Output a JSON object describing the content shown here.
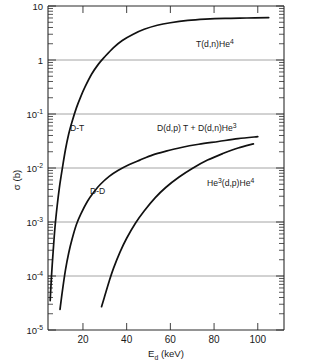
{
  "chart_data": {
    "type": "line",
    "title": "",
    "xlabel": "E_d (keV)",
    "ylabel": "σ (b)",
    "xlabel_parts": {
      "base": "E",
      "sub": "d",
      "units": "(keV)"
    },
    "xscale": "linear",
    "yscale": "log",
    "xlim": [
      4,
      112
    ],
    "ylim": [
      1e-05,
      10
    ],
    "grid": "horizontal-decades",
    "legend": "inline-annotations",
    "xticks": [
      20,
      40,
      60,
      80,
      100
    ],
    "xtick_labels": [
      "20",
      "40",
      "60",
      "80",
      "100"
    ],
    "yticks": [
      10,
      1,
      0.1,
      0.01,
      0.001,
      0.0001,
      1e-05
    ],
    "ytick_labels": [
      "10",
      "1",
      "10",
      "10",
      "10",
      "10",
      "10"
    ],
    "ytick_exponents": [
      "",
      "",
      "-1",
      "-2",
      "-3",
      "-4",
      "-5"
    ],
    "series": [
      {
        "name": "D-T",
        "label": "T(d,n)He4",
        "label_parts": {
          "base": "T(d,n)He",
          "sup": "4"
        },
        "short_label": "D-T",
        "x": [
          5.0,
          5.6,
          6.4,
          7.2,
          8.2,
          9.2,
          10.5,
          12.0,
          13.5,
          15.0,
          17.0,
          19.0,
          21.0,
          24.0,
          27.0,
          30.0,
          34.0,
          38.0,
          43.0,
          48.0,
          54.0,
          60.0,
          68.0,
          76.0,
          85.0,
          95.0,
          105.0
        ],
        "y": [
          3.5e-05,
          0.0001,
          0.0003,
          0.0008,
          0.002,
          0.0043,
          0.0095,
          0.022,
          0.043,
          0.072,
          0.13,
          0.21,
          0.32,
          0.55,
          0.83,
          1.15,
          1.7,
          2.3,
          3.0,
          3.7,
          4.4,
          4.9,
          5.4,
          5.7,
          5.9,
          6.0,
          6.1
        ]
      },
      {
        "name": "D-D",
        "label": "D(d,p) T + D(d,n)He3",
        "label_parts": {
          "base": "D(d,p) T  +  D(d,n)He",
          "sup": "3"
        },
        "short_label": "D-D",
        "x": [
          9.5,
          10.5,
          12.0,
          13.5,
          15.0,
          17.0,
          19.0,
          22.0,
          25.0,
          28.0,
          32.0,
          36.0,
          41.0,
          46.0,
          52.0,
          58.0,
          65.0,
          73.0,
          82.0,
          91.0,
          100.0
        ],
        "y": [
          2.4e-05,
          5e-05,
          0.00013,
          0.00027,
          0.00048,
          0.0009,
          0.0014,
          0.0024,
          0.0036,
          0.005,
          0.007,
          0.009,
          0.0115,
          0.014,
          0.0175,
          0.0205,
          0.024,
          0.0275,
          0.031,
          0.035,
          0.038
        ]
      },
      {
        "name": "He3-D",
        "label": "He3(d,p)He4",
        "label_parts": {
          "pre_sup": "3",
          "base_start": "He",
          "base_end": "(d,p)He",
          "sup": "4"
        },
        "short_label": "",
        "x": [
          28.5,
          30.0,
          32.0,
          34.0,
          37.0,
          40.0,
          44.0,
          48.0,
          53.0,
          58.0,
          64.0,
          70.0,
          77.0,
          84.0,
          91.0,
          98.0
        ],
        "y": [
          2.7e-05,
          4.3e-05,
          8e-05,
          0.00014,
          0.00028,
          0.0005,
          0.00095,
          0.0016,
          0.0028,
          0.0044,
          0.0068,
          0.0098,
          0.014,
          0.0185,
          0.0235,
          0.028
        ]
      }
    ],
    "annotations": [
      {
        "name": "dt-inline-label",
        "text": "D-T"
      },
      {
        "name": "dd-inline-label",
        "text": "D-D"
      }
    ]
  },
  "colors": {
    "curve": "#111111",
    "grid": "#8d8d8d",
    "axis": "#2b2b2b",
    "background": "#ffffff"
  }
}
